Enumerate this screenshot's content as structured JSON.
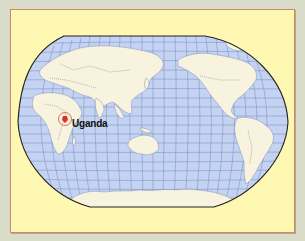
{
  "map": {
    "projection": "Winkel tripel (Pacific-centered)",
    "colors": {
      "page_background": "#d8dcc9",
      "frame_fill": "#fff8b2",
      "frame_border": "#c98a6c",
      "ocean": "#c5d3f2",
      "graticule": "#7f95c8",
      "land": "#f7f3df",
      "border_lines": "#555555",
      "highlight_circle": "#e0604c",
      "highlight_fill": "#d9322a",
      "outline": "#222222"
    },
    "highlight": {
      "label": "Uganda",
      "marker": "circle"
    }
  }
}
